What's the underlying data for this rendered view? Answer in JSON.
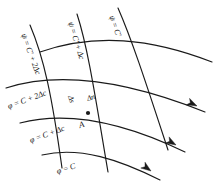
{
  "figure": {
    "kind": "flow-net-diagram",
    "background_color": "#ffffff",
    "line_color": "#1a1a1a",
    "width": 215,
    "height": 184
  },
  "labels": {
    "psi_0": "ψ = C′",
    "psi_1": "ψ = C′ + Δc",
    "psi_2": "ψ = C′ + 2Δc",
    "phi_0": "φ = C",
    "phi_1": "φ = C + Δc",
    "phi_2": "φ = C + 2Δc",
    "delta_s": "Δs",
    "delta_n": "Δn",
    "point_a": "A"
  },
  "geometry": {
    "stream_lines": [
      {
        "name": "phi-C",
        "label_key": "phi_0",
        "path": "M 42,155 C 80,146 120,160 160,180",
        "has_arrow": true
      },
      {
        "name": "phi-C-plus-dc",
        "label_key": "phi_1",
        "path": "M 20,123 C 70,110 125,123 185,152",
        "has_arrow": true
      },
      {
        "name": "phi-C-plus-2dc",
        "label_key": "phi_2",
        "path": "M 6,88 C 62,70 130,82 205,112",
        "has_arrow": true
      },
      {
        "name": "phi-top",
        "label_key": null,
        "path": "M 40,52 C 95,33 150,38 212,62",
        "has_arrow": false
      }
    ],
    "potential_lines": [
      {
        "name": "psi-C-prime-plus-2dc",
        "label_key": "psi_2",
        "path": "M 30,25 C 44,58 52,96 62,168"
      },
      {
        "name": "psi-C-prime-plus-dc",
        "label_key": "psi_1",
        "path": "M 77,14 C 88,48 95,95 108,172"
      },
      {
        "name": "psi-C-prime",
        "label_key": "psi_0",
        "path": "M 118,8 C 132,40 145,80 168,150"
      }
    ],
    "arrows": [
      {
        "name": "flow-arrow-lower",
        "x": 151,
        "y": 171,
        "angle": 36
      },
      {
        "name": "flow-arrow-middle",
        "x": 176,
        "y": 145,
        "angle": 30
      },
      {
        "name": "flow-arrow-upper",
        "x": 197,
        "y": 106,
        "angle": 26
      }
    ],
    "node": {
      "name": "point-a-node",
      "x": 88,
      "y": 113,
      "r": 2.1
    }
  },
  "label_positions": {
    "psi_0": {
      "x": 111,
      "y": 12,
      "rot": 70
    },
    "psi_1": {
      "x": 70,
      "y": 18,
      "rot": 73
    },
    "psi_2": {
      "x": 23,
      "y": 30,
      "rot": 70
    },
    "phi_0": {
      "x": 57,
      "y": 168,
      "rot": -18
    },
    "phi_1": {
      "x": 30,
      "y": 137,
      "rot": -20
    },
    "phi_2": {
      "x": 8,
      "y": 103,
      "rot": -20
    },
    "delta_s": {
      "x": 70,
      "y": 92,
      "rot": 72
    },
    "delta_n": {
      "x": 87,
      "y": 95,
      "rot": -17
    },
    "point_a": {
      "x": 79,
      "y": 121,
      "rot": -17
    }
  }
}
